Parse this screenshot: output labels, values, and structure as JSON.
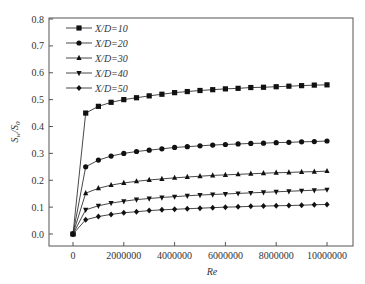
{
  "chart_data": {
    "type": "line",
    "title": "",
    "xlabel": "Re",
    "ylabel": "Sw/S0",
    "xlim": [
      -1000000,
      11000000
    ],
    "ylim": [
      -0.05,
      0.8
    ],
    "x_ticks": [
      0,
      2000000,
      4000000,
      6000000,
      8000000,
      10000000
    ],
    "x_tick_labels": [
      "0",
      "2000000",
      "4000000",
      "6000000",
      "8000000",
      "10000000"
    ],
    "y_ticks": [
      0.0,
      0.1,
      0.2,
      0.3,
      0.4,
      0.5,
      0.6,
      0.7,
      0.8
    ],
    "y_tick_labels": [
      "0.0",
      "0.1",
      "0.2",
      "0.3",
      "0.4",
      "0.5",
      "0.6",
      "0.7",
      "0.8"
    ],
    "grid": false,
    "legend_position": "upper left",
    "x": [
      0,
      500000,
      1000000,
      1500000,
      2000000,
      2500000,
      3000000,
      3500000,
      4000000,
      4500000,
      5000000,
      5500000,
      6000000,
      6500000,
      7000000,
      7500000,
      8000000,
      8500000,
      9000000,
      9500000,
      10000000
    ],
    "series": [
      {
        "name": "X/D=10",
        "marker": "square",
        "values": [
          0.0,
          0.45,
          0.475,
          0.49,
          0.5,
          0.507,
          0.514,
          0.52,
          0.526,
          0.53,
          0.534,
          0.537,
          0.54,
          0.542,
          0.545,
          0.546,
          0.548,
          0.55,
          0.552,
          0.554,
          0.555
        ]
      },
      {
        "name": "X/D=20",
        "marker": "circle",
        "values": [
          0.0,
          0.25,
          0.275,
          0.29,
          0.3,
          0.307,
          0.312,
          0.317,
          0.322,
          0.325,
          0.328,
          0.331,
          0.333,
          0.335,
          0.337,
          0.338,
          0.34,
          0.341,
          0.343,
          0.344,
          0.346
        ]
      },
      {
        "name": "X/D=30",
        "marker": "triangle-up",
        "values": [
          0.0,
          0.152,
          0.17,
          0.182,
          0.19,
          0.196,
          0.201,
          0.205,
          0.209,
          0.212,
          0.215,
          0.218,
          0.22,
          0.222,
          0.224,
          0.226,
          0.228,
          0.229,
          0.231,
          0.232,
          0.234
        ]
      },
      {
        "name": "X/D=40",
        "marker": "triangle-down",
        "values": [
          0.0,
          0.09,
          0.105,
          0.115,
          0.122,
          0.128,
          0.132,
          0.136,
          0.139,
          0.142,
          0.145,
          0.147,
          0.149,
          0.151,
          0.153,
          0.155,
          0.157,
          0.159,
          0.161,
          0.163,
          0.165
        ]
      },
      {
        "name": "X/D=50",
        "marker": "diamond",
        "values": [
          0.0,
          0.053,
          0.065,
          0.073,
          0.079,
          0.083,
          0.087,
          0.09,
          0.092,
          0.094,
          0.096,
          0.098,
          0.1,
          0.101,
          0.103,
          0.104,
          0.105,
          0.106,
          0.107,
          0.109,
          0.11
        ]
      }
    ]
  }
}
